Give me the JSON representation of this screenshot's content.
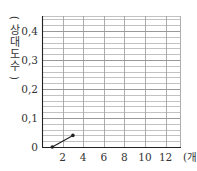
{
  "chart_data": {
    "type": "line",
    "title": "",
    "xlabel": "(개)",
    "ylabel": "(상대도수)",
    "ylabel_chars": [
      "(",
      "상",
      "대",
      "도",
      "수",
      ")"
    ],
    "xlim": [
      0,
      13
    ],
    "ylim": [
      0,
      0.44
    ],
    "x_ticks": [
      2,
      4,
      6,
      8,
      10,
      12
    ],
    "x_tick_labels": [
      "2",
      "4",
      "6",
      "8",
      "10",
      "12"
    ],
    "y_ticks": [
      0,
      0.1,
      0.2,
      0.3,
      0.4
    ],
    "y_tick_labels": [
      "0",
      "0,1",
      "0,2",
      "0,3",
      "0,4"
    ],
    "grid": true,
    "grid_minor_y_step": 0.02,
    "grid_x_step": 2,
    "series": [
      {
        "name": "relative-frequency",
        "x": [
          1,
          3
        ],
        "y": [
          0,
          0.04
        ]
      }
    ],
    "line_color": "#222222",
    "grid_color": "#999999"
  }
}
